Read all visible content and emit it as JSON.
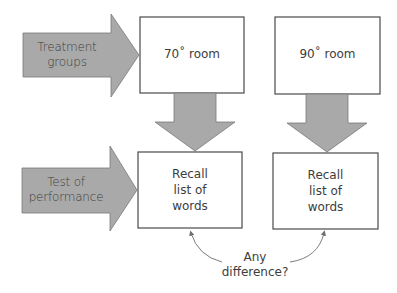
{
  "colors": {
    "arrow_fill": "#a9a9a9",
    "arrow_stroke": "#6e6e6e",
    "box_stroke": "#4a4a4a",
    "text": "#3d3d3d",
    "background": "#ffffff"
  },
  "side_arrows": [
    {
      "line1": "Treatment",
      "line2": "groups"
    },
    {
      "line1": "Test of",
      "line2": "performance"
    }
  ],
  "boxes": {
    "top_left": {
      "label": "70˚ room"
    },
    "top_right": {
      "label": "90˚ room"
    },
    "bottom_left": {
      "line1": "Recall",
      "line2": "list of",
      "line3": "words"
    },
    "bottom_right": {
      "line1": "Recall",
      "line2": "list of",
      "line3": "words"
    }
  },
  "comparison": {
    "line1": "Any",
    "line2": "difference?"
  }
}
